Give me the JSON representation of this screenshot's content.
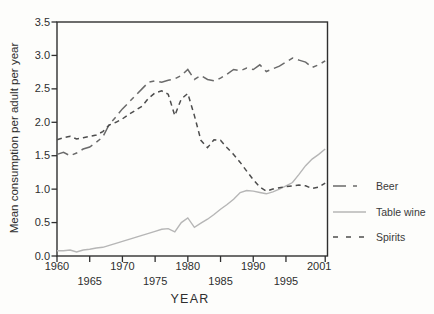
{
  "figure": {
    "y_axis_title": "Mean consumption per adult per year",
    "x_axis_title": "YEAR"
  },
  "colors": {
    "beer_line": "#6a6a6a",
    "table_wine_line": "#b6b6b6",
    "spirits_line": "#4d4d4d",
    "axis": "#2f2f2f",
    "background": "#fdfdfb"
  },
  "chart_data": {
    "type": "line",
    "title": "",
    "xlabel": "YEAR",
    "ylabel": "Mean consumption per adult per year",
    "xlim": [
      1960,
      2001.35
    ],
    "ylim": [
      0,
      3.5
    ],
    "grid": false,
    "legend_position": "right-outside",
    "x_tick_labels": [
      "1960",
      "1965",
      "1970",
      "1975",
      "1980",
      "1985",
      "1990",
      "1995",
      "2001"
    ],
    "x_tick_values": [
      1960,
      1965,
      1970,
      1975,
      1980,
      1985,
      1990,
      1995,
      2001
    ],
    "y_tick_labels": [
      "0.0",
      "0.5",
      "1.0",
      "1.5",
      "2.0",
      "2.5",
      "3.0",
      "3.5"
    ],
    "y_tick_values": [
      0,
      0.5,
      1.0,
      1.5,
      2.0,
      2.5,
      3.0,
      3.5
    ],
    "x": [
      1960,
      1961,
      1962,
      1963,
      1964,
      1965,
      1966,
      1967,
      1968,
      1969,
      1970,
      1971,
      1972,
      1973,
      1974,
      1975,
      1976,
      1977,
      1978,
      1979,
      1980,
      1981,
      1982,
      1983,
      1984,
      1985,
      1986,
      1987,
      1988,
      1989,
      1990,
      1991,
      1992,
      1993,
      1994,
      1995,
      1996,
      1997,
      1998,
      1999,
      2000,
      2001
    ],
    "series": [
      {
        "name": "Beer",
        "dash": "long",
        "color": "#6a6a6a",
        "values": [
          1.52,
          1.55,
          1.5,
          1.54,
          1.6,
          1.63,
          1.7,
          1.78,
          1.97,
          2.08,
          2.2,
          2.3,
          2.4,
          2.5,
          2.6,
          2.62,
          2.6,
          2.63,
          2.65,
          2.7,
          2.79,
          2.64,
          2.7,
          2.64,
          2.62,
          2.66,
          2.72,
          2.79,
          2.77,
          2.81,
          2.79,
          2.86,
          2.76,
          2.8,
          2.84,
          2.9,
          2.96,
          2.93,
          2.9,
          2.82,
          2.86,
          2.92
        ]
      },
      {
        "name": "Table wine",
        "dash": "solid",
        "color": "#b6b6b6",
        "values": [
          0.08,
          0.08,
          0.09,
          0.06,
          0.09,
          0.1,
          0.12,
          0.13,
          0.16,
          0.19,
          0.22,
          0.25,
          0.28,
          0.31,
          0.34,
          0.37,
          0.4,
          0.41,
          0.36,
          0.5,
          0.57,
          0.43,
          0.49,
          0.55,
          0.62,
          0.7,
          0.77,
          0.85,
          0.95,
          0.98,
          0.97,
          0.95,
          0.93,
          0.96,
          1.0,
          1.05,
          1.1,
          1.22,
          1.35,
          1.45,
          1.52,
          1.6
        ]
      },
      {
        "name": "Spirits",
        "dash": "short",
        "color": "#4d4d4d",
        "values": [
          1.74,
          1.77,
          1.79,
          1.75,
          1.77,
          1.79,
          1.81,
          1.86,
          1.96,
          2.0,
          2.05,
          2.12,
          2.18,
          2.24,
          2.36,
          2.44,
          2.47,
          2.42,
          2.1,
          2.35,
          2.43,
          2.1,
          1.73,
          1.62,
          1.74,
          1.73,
          1.62,
          1.52,
          1.4,
          1.27,
          1.14,
          1.03,
          0.97,
          1.0,
          1.02,
          1.04,
          1.05,
          1.06,
          1.05,
          1.01,
          1.03,
          1.09
        ]
      }
    ]
  }
}
